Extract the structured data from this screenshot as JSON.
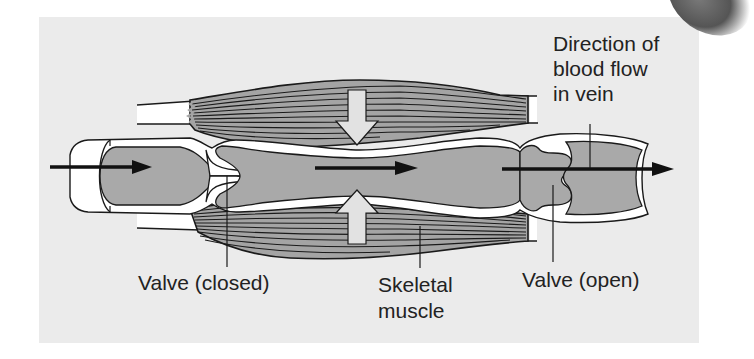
{
  "figure": {
    "colors": {
      "page_background": "#ffffff",
      "panel_background": "#ebebeb",
      "vein_fill": "#a9a9a9",
      "vein_wall": "#ffffff",
      "muscle_fill": "#a4a4a4",
      "outline": "#1a1a1a",
      "compression_arrow": "#e2e2e2",
      "flow_arrow": "#111111"
    },
    "labels": {
      "direction": [
        "Direction of",
        "blood flow",
        "in vein"
      ],
      "valve_closed": "Valve (closed)",
      "skeletal_muscle": [
        "Skeletal",
        "muscle"
      ],
      "valve_open": "Valve (open)"
    },
    "elements": {
      "upper_muscle": "contracting skeletal muscle above vein",
      "lower_muscle": "contracting skeletal muscle below vein",
      "compression_arrows": [
        "down",
        "up"
      ],
      "flow_arrows": 3
    }
  }
}
